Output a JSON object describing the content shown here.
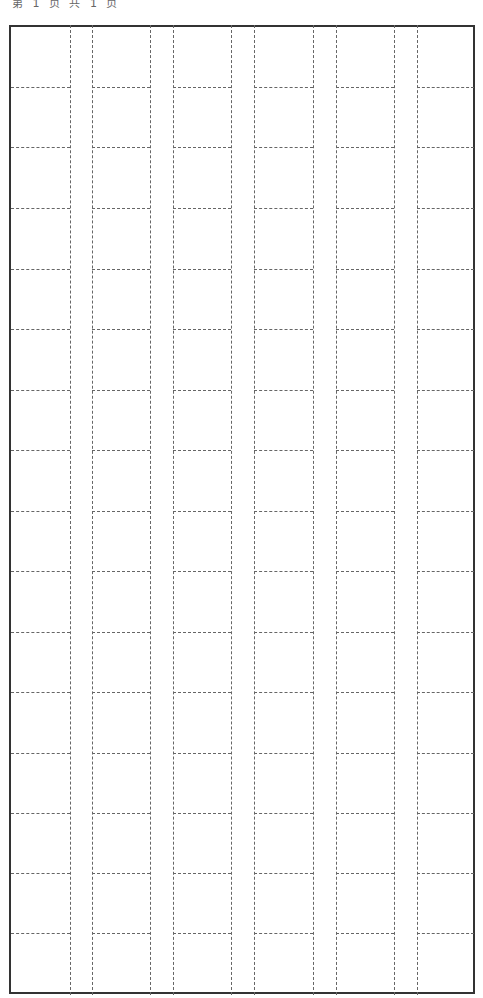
{
  "header": {
    "text": "第 1 页 共 1 页"
  },
  "grid": {
    "type": "dashed writing grid",
    "columns": 6,
    "rows": 16,
    "line_color": "#666666",
    "border_color": "#333333",
    "vertical_lines_x": [
      70,
      92,
      150,
      173,
      231,
      254,
      313,
      336,
      394,
      417
    ],
    "horizontal_lines_y": [
      87,
      147,
      208,
      269,
      329,
      390,
      450,
      511,
      571,
      632,
      692,
      753,
      813,
      873,
      933
    ],
    "column_spans": [
      [
        11,
        70
      ],
      [
        92,
        150
      ],
      [
        173,
        231
      ],
      [
        254,
        313
      ],
      [
        336,
        394
      ],
      [
        417,
        474
      ]
    ]
  }
}
